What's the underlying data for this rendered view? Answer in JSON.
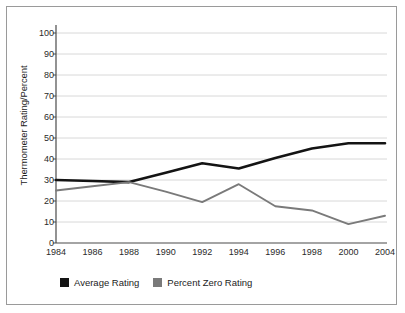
{
  "chart_data": {
    "type": "line",
    "title": "",
    "xlabel": "",
    "ylabel": "Thermometer Rating/Percent",
    "categories": [
      "1984",
      "1986",
      "1988",
      "1990",
      "1992",
      "1994",
      "1996",
      "1998",
      "2000",
      "2004"
    ],
    "yticks": [
      0,
      10,
      20,
      30,
      40,
      50,
      60,
      70,
      80,
      90,
      100
    ],
    "ylim": [
      0,
      100
    ],
    "grid": true,
    "legend_position": "bottom-left",
    "series": [
      {
        "name": "Average Rating",
        "color": "#141414",
        "values": [
          30,
          29.5,
          29,
          33.5,
          38,
          35.5,
          40.5,
          45,
          47.5,
          47.5
        ]
      },
      {
        "name": "Percent Zero Rating",
        "color": "#7a7a7a",
        "values": [
          25,
          27,
          29,
          24.5,
          19.5,
          28,
          17.5,
          15.5,
          9,
          13
        ]
      }
    ]
  },
  "axis": {
    "y_title": "Thermometer Rating/Percent",
    "y_tick_labels": [
      "100",
      "90",
      "80",
      "70",
      "60",
      "50",
      "40",
      "30",
      "20",
      "10",
      "0"
    ],
    "x_tick_labels": [
      "1984",
      "1986",
      "1988",
      "1990",
      "1992",
      "1994",
      "1996",
      "1998",
      "2000",
      "2004"
    ]
  },
  "legend": {
    "items": [
      {
        "label": "Average Rating",
        "color": "#141414"
      },
      {
        "label": "Percent Zero Rating",
        "color": "#7a7a7a"
      }
    ]
  },
  "style": {
    "frame_color": "#9a9a9a",
    "grid_color": "#d8d8d8",
    "axis_color": "#4a4a4a",
    "background": "#ffffff"
  }
}
